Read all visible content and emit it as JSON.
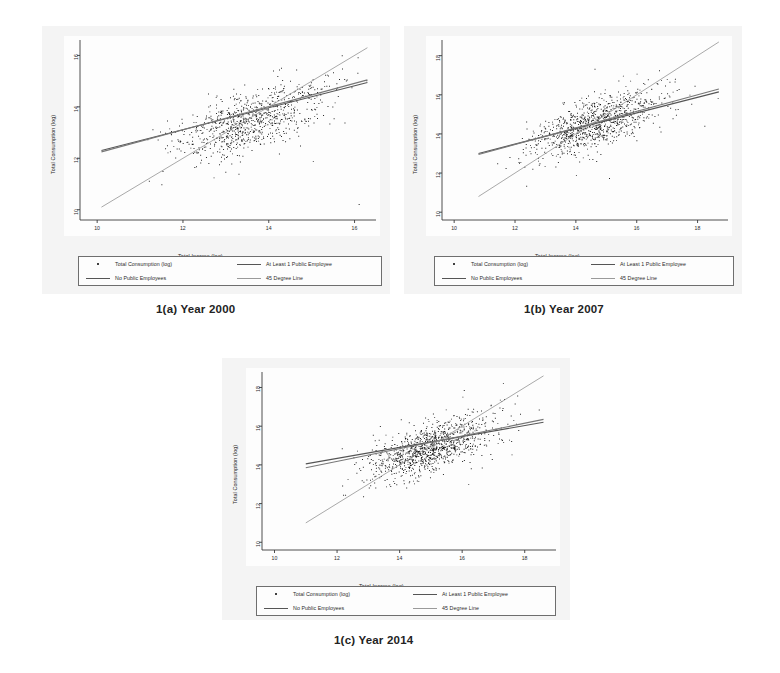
{
  "document": {
    "background_color": "#ffffff",
    "panel_color": "#f4f4f4",
    "plot_color": "#fdfdfd",
    "ink_color": "#1a1a1a",
    "fit_line_color": "#555555",
    "reference_line_color": "#9a9a9a"
  },
  "figures": [
    {
      "id": "fig-1a",
      "caption": "1(a) Year 2000",
      "chart_data": {
        "type": "scatter",
        "title": "",
        "xlabel": "Total Income (log)",
        "ylabel": "Total Consumption (log)",
        "xlim": [
          9.6,
          16.5
        ],
        "ylim": [
          9.6,
          16.6
        ],
        "xticks": [
          10,
          12,
          14,
          16
        ],
        "yticks": [
          10,
          12,
          14,
          16
        ],
        "xticklabels": [
          "10",
          "12",
          "14",
          "16"
        ],
        "yticklabels": [
          "10",
          "12",
          "14",
          "16"
        ],
        "grid": false,
        "legend_position": "below-axes",
        "series": [
          {
            "name": "Total Consumption (log)",
            "type": "scatter",
            "marker": "dot",
            "color": "#1a1a1a",
            "n_points": 900,
            "cloud": {
              "x_center": 13.55,
              "y_center": 13.5,
              "x_sd": 0.85,
              "y_sd": 0.72,
              "correlation": 0.62,
              "x_range": [
                10.1,
                16.3
              ],
              "y_range": [
                10.6,
                16.2
              ]
            }
          },
          {
            "name": "At Least 1 Public Employee",
            "type": "line",
            "color": "#555555",
            "endpoints": [
              [
                10.1,
                12.3
              ],
              [
                16.3,
                14.95
              ]
            ],
            "slope": 0.43
          },
          {
            "name": "No Public Employees",
            "type": "line",
            "color": "#777777",
            "endpoints": [
              [
                10.1,
                12.25
              ],
              [
                16.3,
                15.05
              ]
            ],
            "slope": 0.45
          },
          {
            "name": "45 Degree Line",
            "type": "line",
            "color": "#9a9a9a",
            "endpoints": [
              [
                10.1,
                10.1
              ],
              [
                16.3,
                16.3
              ]
            ],
            "slope": 1.0
          }
        ],
        "legend": [
          "Total Consumption (log)",
          "At Least 1 Public Employee",
          "No Public Employees",
          "45 Degree Line"
        ]
      }
    },
    {
      "id": "fig-1b",
      "caption": "1(b) Year 2007",
      "chart_data": {
        "type": "scatter",
        "title": "",
        "xlabel": "Total Income (log)",
        "ylabel": "Total Consumption (log)",
        "xlim": [
          9.6,
          19.0
        ],
        "ylim": [
          9.6,
          18.8
        ],
        "xticks": [
          10,
          12,
          14,
          16,
          18
        ],
        "yticks": [
          10,
          12,
          14,
          16,
          18
        ],
        "xticklabels": [
          "10",
          "12",
          "14",
          "16",
          "18"
        ],
        "yticklabels": [
          "10",
          "12",
          "14",
          "16",
          "18"
        ],
        "grid": false,
        "legend_position": "below-axes",
        "series": [
          {
            "name": "Total Consumption (log)",
            "type": "scatter",
            "marker": "dot",
            "color": "#1a1a1a",
            "n_points": 1000,
            "cloud": {
              "x_center": 14.6,
              "y_center": 14.55,
              "x_sd": 1.05,
              "y_sd": 0.82,
              "correlation": 0.66,
              "x_range": [
                10.8,
                18.7
              ],
              "y_range": [
                12.2,
                16.6
              ]
            }
          },
          {
            "name": "At Least 1 Public Employee",
            "type": "line",
            "color": "#555555",
            "endpoints": [
              [
                10.8,
                13.0
              ],
              [
                18.7,
                16.15
              ]
            ],
            "slope": 0.4
          },
          {
            "name": "No Public Employees",
            "type": "line",
            "color": "#777777",
            "endpoints": [
              [
                10.8,
                12.95
              ],
              [
                18.7,
                16.3
              ]
            ],
            "slope": 0.42
          },
          {
            "name": "45 Degree Line",
            "type": "line",
            "color": "#9a9a9a",
            "endpoints": [
              [
                10.8,
                10.8
              ],
              [
                18.7,
                18.7
              ]
            ],
            "slope": 1.0
          }
        ],
        "legend": [
          "Total Consumption (log)",
          "At Least 1 Public Employee",
          "No Public Employees",
          "45 Degree Line"
        ]
      }
    },
    {
      "id": "fig-1c",
      "caption": "1(c) Year 2014",
      "chart_data": {
        "type": "scatter",
        "title": "",
        "xlabel": "Total Income (log)",
        "ylabel": "Total Consumption (log)",
        "xlim": [
          9.6,
          19.0
        ],
        "ylim": [
          9.6,
          18.8
        ],
        "xticks": [
          10,
          12,
          14,
          16,
          18
        ],
        "yticks": [
          10,
          12,
          14,
          16,
          18
        ],
        "xticklabels": [
          "10",
          "12",
          "14",
          "16",
          "18"
        ],
        "yticklabels": [
          "10",
          "12",
          "14",
          "16",
          "18"
        ],
        "grid": false,
        "legend_position": "below-axes",
        "series": [
          {
            "name": "Total Consumption (log)",
            "type": "scatter",
            "marker": "dot",
            "color": "#1a1a1a",
            "n_points": 1100,
            "cloud": {
              "x_center": 15.0,
              "y_center": 14.9,
              "x_sd": 1.0,
              "y_sd": 0.78,
              "correlation": 0.68,
              "x_range": [
                11.2,
                18.6
              ],
              "y_range": [
                12.1,
                17.2
              ]
            }
          },
          {
            "name": "At Least 1 Public Employee",
            "type": "line",
            "color": "#555555",
            "endpoints": [
              [
                11.0,
                14.05
              ],
              [
                18.6,
                16.2
              ]
            ],
            "slope": 0.28
          },
          {
            "name": "No Public Employees",
            "type": "line",
            "color": "#777777",
            "endpoints": [
              [
                11.0,
                13.85
              ],
              [
                18.6,
                16.35
              ]
            ],
            "slope": 0.33
          },
          {
            "name": "45 Degree Line",
            "type": "line",
            "color": "#9a9a9a",
            "endpoints": [
              [
                11.0,
                11.0
              ],
              [
                18.6,
                18.6
              ]
            ],
            "slope": 1.0
          }
        ],
        "legend": [
          "Total Consumption (log)",
          "At Least 1 Public Employee",
          "No Public Employees",
          "45 Degree Line"
        ]
      }
    }
  ]
}
